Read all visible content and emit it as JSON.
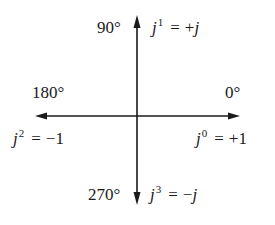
{
  "diagram": {
    "type": "complex-plane-rotation",
    "axes": {
      "origin": {
        "x": 137,
        "y": 116
      },
      "horizontal": {
        "left_tip_x": 35,
        "right_tip_x": 240
      },
      "vertical": {
        "top_tip_y": 15,
        "bottom_tip_y": 205
      },
      "color": "#1a1a1a"
    },
    "labels": {
      "up": {
        "angle": "90°",
        "base": "j",
        "exponent": "1",
        "eq": "=",
        "value_sign": "+",
        "value": "j"
      },
      "left": {
        "angle": "180°",
        "base": "j",
        "exponent": "2",
        "eq": "=",
        "value_sign": "−",
        "value": "1"
      },
      "right": {
        "angle": "0°",
        "base": "j",
        "exponent": "0",
        "eq": "=",
        "value_sign": "+",
        "value": "1"
      },
      "down": {
        "angle": "270°",
        "base": "j",
        "exponent": "3",
        "eq": "=",
        "value_sign": "−",
        "value": "j"
      }
    }
  }
}
